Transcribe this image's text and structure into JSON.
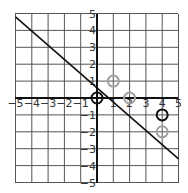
{
  "chart_data": {
    "type": "scatter",
    "title": "",
    "xlabel": "",
    "ylabel": "",
    "xlim": [
      -5,
      5
    ],
    "ylim": [
      -5,
      5
    ],
    "grid": true,
    "x_ticks": [
      "-5",
      "-4",
      "-3",
      "-2",
      "-1",
      "1",
      "2",
      "3",
      "4",
      "5"
    ],
    "y_ticks": [
      "5",
      "4",
      "3",
      "2",
      "1",
      "-1",
      "-2",
      "-3",
      "-4",
      "-5"
    ],
    "line": {
      "x1": -5,
      "y1": 4.8,
      "x2": 5,
      "y2": -3.6,
      "color": "#111111"
    },
    "series": [
      {
        "name": "black points",
        "color": "#111111",
        "points": [
          [
            0,
            0
          ],
          [
            4,
            -1
          ]
        ]
      },
      {
        "name": "gray points",
        "color": "#a0a0a0",
        "points": [
          [
            1,
            1
          ],
          [
            2,
            0
          ],
          [
            4,
            -2
          ]
        ]
      }
    ]
  }
}
